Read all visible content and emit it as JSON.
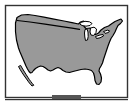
{
  "widget": {
    "name": "us-map-thumbnail",
    "kind": "static-map-image",
    "title": "United States",
    "alt_text": "Outline map of the contiguous United States, gray fill with black border"
  },
  "canvas": {
    "width": 134,
    "height": 105,
    "background_color": "#ffffff"
  },
  "frame": {
    "x": 5,
    "y": 5,
    "width": 123,
    "height": 93,
    "border_color": "#333333",
    "border_width": 1,
    "fill_color": "#ffffff"
  },
  "map": {
    "region_label": "Contiguous United States",
    "land_fill_color": "#999999",
    "outline_color": "#000000",
    "outline_width": 1,
    "water_fill_color": "#ffffff",
    "features": [
      {
        "name": "conterminous-united-states",
        "type": "landmass",
        "fill": "#999999"
      },
      {
        "name": "baja-california-peninsula",
        "type": "landmass",
        "fill": "#999999"
      },
      {
        "name": "lake-superior",
        "type": "water",
        "fill": "#ffffff"
      },
      {
        "name": "lake-michigan",
        "type": "water",
        "fill": "#ffffff"
      },
      {
        "name": "lake-huron",
        "type": "water",
        "fill": "#ffffff"
      },
      {
        "name": "lake-erie",
        "type": "water",
        "fill": "#ffffff"
      },
      {
        "name": "lake-ontario",
        "type": "water",
        "fill": "#ffffff"
      },
      {
        "name": "florida-peninsula",
        "type": "landmass",
        "fill": "#999999"
      },
      {
        "name": "northern-border-49th-parallel",
        "type": "boundary-line",
        "fill": "#000000"
      }
    ]
  },
  "bottom_tab": {
    "name": "bottom-tab-notch",
    "x": 52,
    "y": 95,
    "width": 29,
    "height": 5,
    "color": "#555555"
  },
  "baseline": {
    "name": "bottom-rule",
    "x": 5,
    "y": 99,
    "width": 123,
    "height": 1,
    "color": "#333333"
  }
}
